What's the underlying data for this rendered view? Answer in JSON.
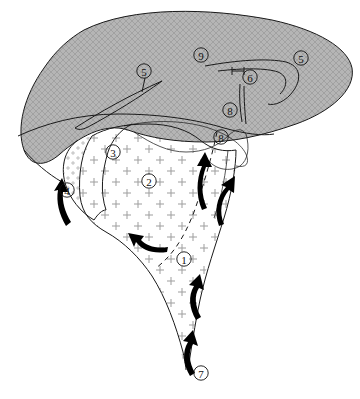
{
  "figure": {
    "kind": "geological-block-diagram",
    "title": "",
    "background_color": "#ffffff",
    "line_color": "#1a1a1a",
    "shaded_unit_color": "#b3b3b3",
    "stipple_unit_color": "#ffffff",
    "plus_mark_color": "#9a9a9a"
  },
  "labels": [
    {
      "id": "label-1",
      "text": "①",
      "number": "1",
      "x": 184,
      "y": 259
    },
    {
      "id": "label-2",
      "text": "②",
      "number": "2",
      "x": 149,
      "y": 181
    },
    {
      "id": "label-3",
      "text": "③",
      "number": "3",
      "x": 113,
      "y": 152
    },
    {
      "id": "label-4",
      "text": "④",
      "number": "4",
      "x": 67,
      "y": 190
    },
    {
      "id": "label-5-left",
      "text": "⑤",
      "number": "5",
      "x": 144,
      "y": 71
    },
    {
      "id": "label-5-right",
      "text": "⑤",
      "number": "5",
      "x": 301,
      "y": 58
    },
    {
      "id": "label-6",
      "text": "⑥",
      "number": "6",
      "x": 250,
      "y": 77
    },
    {
      "id": "label-7",
      "text": "⑦",
      "number": "7",
      "x": 201,
      "y": 373
    },
    {
      "id": "label-8-upper",
      "text": "⑧",
      "number": "8",
      "x": 230,
      "y": 110
    },
    {
      "id": "label-8-lower",
      "text": "⑧",
      "number": "8",
      "x": 221,
      "y": 137
    },
    {
      "id": "label-9",
      "text": "⑨",
      "number": "9",
      "x": 201,
      "y": 55
    }
  ],
  "units": [
    {
      "id": "unit-shaded-cap",
      "label_refs": [
        "9",
        "5",
        "6",
        "8"
      ],
      "pattern": "cross-hatch",
      "fill": "#b3b3b3"
    },
    {
      "id": "unit-stipple-body",
      "label_refs": [
        "2",
        "1"
      ],
      "pattern": "plus-marks",
      "fill": "#ffffff"
    },
    {
      "id": "unit-margin-band",
      "label_refs": [
        "3",
        "4"
      ],
      "pattern": "fine-plus",
      "fill": "#ffffff"
    }
  ],
  "arrows": [
    {
      "id": "arrow-4",
      "near_label": "4",
      "direction": "up"
    },
    {
      "id": "arrow-8",
      "near_label": "8",
      "direction": "up"
    },
    {
      "id": "arrow-right-upper",
      "near_label": "1",
      "direction": "up"
    },
    {
      "id": "arrow-1-left",
      "near_label": "1",
      "direction": "up-left"
    },
    {
      "id": "arrow-stem-mid",
      "near_label": "1",
      "direction": "up"
    },
    {
      "id": "arrow-7",
      "near_label": "7",
      "direction": "up"
    }
  ]
}
